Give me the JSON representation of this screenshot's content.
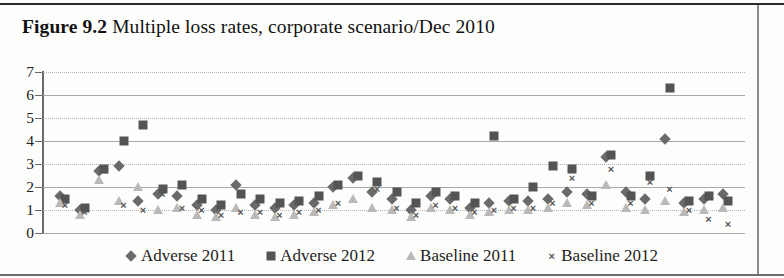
{
  "figure": {
    "label": "Figure 9.2",
    "caption": "Multiple loss rates, corporate scenario/Dec 2010"
  },
  "legend": {
    "position": "bottom-center",
    "items": [
      {
        "label": "Adverse 2011",
        "marker": "diamond",
        "color": "#6a6a6a"
      },
      {
        "label": "Adverse 2012",
        "marker": "square",
        "color": "#545454"
      },
      {
        "label": "Baseline 2011",
        "marker": "triangle",
        "color": "#b9b9b9"
      },
      {
        "label": "Baseline 2012",
        "marker": "x",
        "color": "#585858"
      }
    ]
  },
  "axis": {
    "y_ticks": [
      "0",
      "1",
      "2",
      "3",
      "4",
      "5",
      "6",
      "7"
    ],
    "y_min": 0,
    "y_max": 7,
    "x_ticks": [],
    "grid": true
  },
  "chart_data": {
    "type": "scatter",
    "title": "Multiple loss rates, corporate scenario/Dec 2010",
    "xlabel": "",
    "ylabel": "",
    "ylim": [
      0,
      7
    ],
    "xlim": [
      0,
      36
    ],
    "grid": true,
    "legend_position": "bottom-center",
    "x": [
      1,
      2,
      3,
      4,
      5,
      6,
      7,
      8,
      9,
      10,
      11,
      12,
      13,
      14,
      15,
      16,
      17,
      18,
      19,
      20,
      21,
      22,
      23,
      24,
      25,
      26,
      27,
      28,
      29,
      30,
      31,
      32,
      33,
      34,
      35
    ],
    "series": [
      {
        "name": "Adverse 2011",
        "marker": "diamond",
        "color": "#6a6a6a",
        "values": [
          1.6,
          1.0,
          2.7,
          2.9,
          1.4,
          1.7,
          1.6,
          1.2,
          1.0,
          2.1,
          1.2,
          1.1,
          1.2,
          1.3,
          2.0,
          2.4,
          1.8,
          1.5,
          1.0,
          1.6,
          1.5,
          1.1,
          1.3,
          1.4,
          1.4,
          1.5,
          1.8,
          1.7,
          3.3,
          1.8,
          1.5,
          4.1,
          1.3,
          1.5,
          1.7
        ]
      },
      {
        "name": "Adverse 2012",
        "marker": "square",
        "color": "#545454",
        "values": [
          1.5,
          1.1,
          2.8,
          4.0,
          4.7,
          1.9,
          2.1,
          1.5,
          1.2,
          1.7,
          1.5,
          1.3,
          1.4,
          1.6,
          2.1,
          2.5,
          2.2,
          1.8,
          1.3,
          1.8,
          1.6,
          1.3,
          4.2,
          1.5,
          2.0,
          2.9,
          2.8,
          1.6,
          3.4,
          1.6,
          2.5,
          6.3,
          1.4,
          1.6,
          1.4
        ]
      },
      {
        "name": "Baseline 2011",
        "marker": "triangle",
        "color": "#b9b9b9",
        "values": [
          1.3,
          0.8,
          2.3,
          1.4,
          2.0,
          1.0,
          1.1,
          0.8,
          0.7,
          1.1,
          0.8,
          0.7,
          0.8,
          0.9,
          1.2,
          1.5,
          1.1,
          1.0,
          0.7,
          1.1,
          1.0,
          0.8,
          0.9,
          1.0,
          1.0,
          1.1,
          1.3,
          1.2,
          2.1,
          1.1,
          1.0,
          1.4,
          0.9,
          1.0,
          1.1
        ]
      },
      {
        "name": "Baseline 2012",
        "marker": "x",
        "color": "#585858",
        "values": [
          1.2,
          0.9,
          2.7,
          1.2,
          1.0,
          1.7,
          1.1,
          1.0,
          0.8,
          0.9,
          0.9,
          0.8,
          0.9,
          1.0,
          1.3,
          2.5,
          1.9,
          1.1,
          0.8,
          1.2,
          1.1,
          0.9,
          1.0,
          1.1,
          1.1,
          1.3,
          2.4,
          1.3,
          2.8,
          1.3,
          2.2,
          1.9,
          1.0,
          0.6,
          0.4
        ]
      }
    ]
  }
}
